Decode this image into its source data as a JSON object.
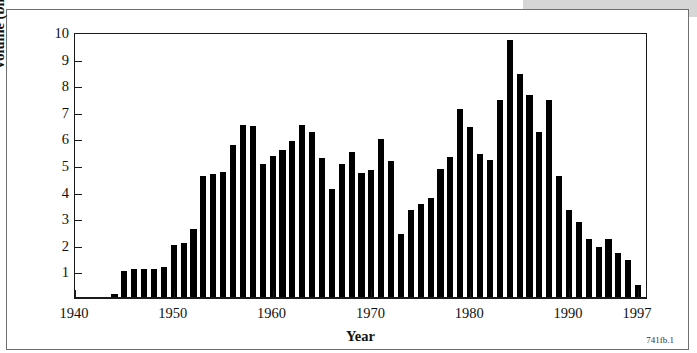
{
  "figure": {
    "id_caption": "741fb.1"
  },
  "chart_data": {
    "type": "bar",
    "title": "",
    "xlabel": "Year",
    "ylabel": "Volume (billions of gallons)",
    "xlim": [
      1940,
      1998
    ],
    "ylim": [
      0,
      10
    ],
    "grid": false,
    "legend": null,
    "xticks": [
      1940,
      1950,
      1960,
      1970,
      1980,
      1990,
      1997
    ],
    "xtick_labels": [
      "1940",
      "1950",
      "1960",
      "1970",
      "1980",
      "1990",
      "1997"
    ],
    "yticks": [
      1,
      2,
      3,
      4,
      5,
      6,
      7,
      8,
      9,
      10
    ],
    "ytick_labels": [
      "1",
      "2",
      "3",
      "4",
      "5",
      "6",
      "7",
      "8",
      "9",
      "10"
    ],
    "bar_color": "#000000",
    "categories": [
      1944,
      1945,
      1946,
      1947,
      1948,
      1949,
      1950,
      1951,
      1952,
      1953,
      1954,
      1955,
      1956,
      1957,
      1958,
      1959,
      1960,
      1961,
      1962,
      1963,
      1964,
      1965,
      1966,
      1967,
      1968,
      1969,
      1970,
      1971,
      1972,
      1973,
      1974,
      1975,
      1976,
      1977,
      1978,
      1979,
      1980,
      1981,
      1982,
      1983,
      1984,
      1985,
      1986,
      1987,
      1988,
      1989,
      1990,
      1991,
      1992,
      1993,
      1994,
      1995,
      1996,
      1997
    ],
    "values": [
      0.15,
      1.0,
      1.08,
      1.08,
      1.08,
      1.15,
      2.0,
      2.05,
      2.6,
      4.6,
      4.68,
      4.72,
      5.75,
      6.5,
      6.45,
      5.05,
      5.35,
      5.55,
      5.9,
      6.5,
      6.25,
      5.25,
      4.1,
      5.02,
      5.5,
      4.7,
      4.8,
      5.98,
      5.15,
      2.4,
      3.3,
      3.55,
      3.75,
      4.85,
      5.3,
      7.1,
      6.42,
      5.4,
      5.2,
      7.45,
      9.7,
      8.42,
      7.65,
      6.25,
      7.45,
      4.6,
      3.32,
      2.85,
      2.2,
      1.9,
      2.2,
      1.68,
      1.44,
      0.5
    ]
  }
}
